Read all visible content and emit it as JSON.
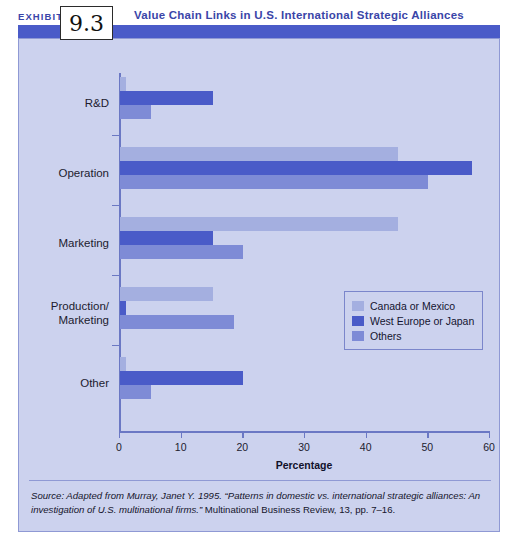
{
  "exhibit": {
    "label": "EXHIBIT",
    "number": "9.3",
    "title": "Value Chain Links in U.S. International Strategic Alliances"
  },
  "colors": {
    "accent_bar": "#4a5bc8",
    "panel_bg": "#ccd2ee",
    "series_canada_mexico": "#a4afe0",
    "series_west_europe_japan": "#4a5bc8",
    "series_others": "#7e8bd6",
    "axis": "#6b78c4",
    "title_text": "#3a45a8"
  },
  "chart_data": {
    "type": "bar",
    "orientation": "horizontal",
    "title": "Value Chain Links in U.S. International Strategic Alliances",
    "xlabel": "Percentage",
    "ylabel": "",
    "xlim": [
      0,
      60
    ],
    "xticks": [
      0,
      10,
      20,
      30,
      40,
      50,
      60
    ],
    "xtick_labels": [
      "0",
      "10",
      "20",
      "30",
      "40",
      "50",
      "60"
    ],
    "grid": false,
    "legend_position": "center-right",
    "categories": [
      "R&D",
      "Operation",
      "Marketing",
      "Production/\nMarketing",
      "Other"
    ],
    "series": [
      {
        "name": "Canada or Mexico",
        "color": "#a4afe0",
        "values": [
          1,
          45,
          45,
          15,
          1
        ]
      },
      {
        "name": "West Europe or Japan",
        "color": "#4a5bc8",
        "values": [
          15,
          57,
          15,
          1,
          20
        ]
      },
      {
        "name": "Others",
        "color": "#7e8bd6",
        "values": [
          5,
          50,
          20,
          18.5,
          5
        ]
      }
    ]
  },
  "categories": [
    {
      "label_line1": "R&D",
      "label_line2": ""
    },
    {
      "label_line1": "Operation",
      "label_line2": ""
    },
    {
      "label_line1": "Marketing",
      "label_line2": ""
    },
    {
      "label_line1": "Production/",
      "label_line2": "Marketing"
    },
    {
      "label_line1": "Other",
      "label_line2": ""
    }
  ],
  "legend": {
    "items": [
      {
        "label": "Canada or Mexico"
      },
      {
        "label": "West Europe or Japan"
      },
      {
        "label": "Others"
      }
    ]
  },
  "axis": {
    "x_title": "Percentage"
  },
  "source": {
    "line1_italic": "Source: Adapted from Murray, Janet Y. 1995. “Patterns in domestic vs. international strategic alliances:",
    "line2_italic": "An investigation of U.S. multinational firms.”",
    "line2_rest": " Multinational Business Review, 13, pp. 7–16."
  }
}
